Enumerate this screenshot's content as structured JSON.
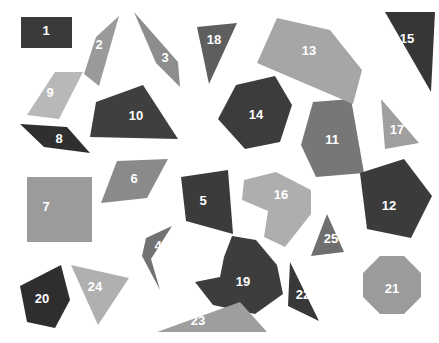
{
  "canvas": {
    "width": 439,
    "height": 343,
    "background": "#ffffff",
    "title": "shape-scatter-figure"
  },
  "palette": {
    "very_dark": "#333333",
    "dark": "#3d3d3d",
    "dark_gray": "#4a4a4a",
    "mid_dark": "#6b6b6b",
    "mid": "#808080",
    "mid_gray": "#999999",
    "light_gray": "#a8a8a8",
    "lighter_gray": "#b5b5b5",
    "lightest_gray": "#c2c2c2",
    "label_color": "#ffffff"
  },
  "chart_data": {
    "type": "scatter",
    "title": "",
    "xlabel": "",
    "ylabel": "",
    "grid": false,
    "legend": "none",
    "xlim": [
      0,
      439
    ],
    "ylim": [
      0,
      343
    ],
    "shape_count": 25
  },
  "shapes": [
    {
      "id": 1,
      "label": "1",
      "kind": "rectangle",
      "color": "#3a3a3a",
      "points": "21,17 72,17 72,48 21,48",
      "label_x": 46,
      "label_y": 32
    },
    {
      "id": 2,
      "label": "2",
      "kind": "quadrilateral",
      "color": "#9a9a9a",
      "points": "119,16 96,37 84,74 99,86",
      "label_x": 99,
      "label_y": 46
    },
    {
      "id": 3,
      "label": "3",
      "kind": "quadrilateral",
      "color": "#8d8d8d",
      "points": "134,12 178,62 180,87 156,63",
      "label_x": 165,
      "label_y": 59
    },
    {
      "id": 4,
      "label": "4",
      "kind": "arrow",
      "color": "#727272",
      "points": "172,226 151,259 160,290 142,256 146,238",
      "label_x": 158,
      "label_y": 247
    },
    {
      "id": 5,
      "label": "5",
      "kind": "quadrilateral",
      "color": "#3b3b3b",
      "points": "181,177 228,170 233,234 186,221",
      "label_x": 203,
      "label_y": 202
    },
    {
      "id": 6,
      "label": "6",
      "kind": "parallelogram",
      "color": "#8a8a8a",
      "points": "117,161 168,159 147,198 101,203",
      "label_x": 134,
      "label_y": 180
    },
    {
      "id": 7,
      "label": "7",
      "kind": "square",
      "color": "#9b9b9b",
      "points": "27,177 92,177 92,242 27,242",
      "label_x": 46,
      "label_y": 208
    },
    {
      "id": 8,
      "label": "8",
      "kind": "sliver-parallelogram",
      "color": "#2f2f2f",
      "points": "20,124 67,127 90,153 44,147",
      "label_x": 59,
      "label_y": 140
    },
    {
      "id": 9,
      "label": "9",
      "kind": "parallelogram",
      "color": "#b8b8b8",
      "points": "55,72 83,72 59,119 27,115",
      "label_x": 50,
      "label_y": 94
    },
    {
      "id": 10,
      "label": "10",
      "kind": "quadrilateral",
      "color": "#3f3f3f",
      "points": "96,102 143,85 178,139 90,137",
      "label_x": 136,
      "label_y": 117
    },
    {
      "id": 11,
      "label": "11",
      "kind": "pentagon",
      "color": "#777777",
      "points": "313,102 351,99 364,173 316,177 301,145",
      "label_x": 332,
      "label_y": 141
    },
    {
      "id": 12,
      "label": "12",
      "kind": "pentagon",
      "color": "#3b3b3b",
      "points": "360,173 404,159 432,196 411,238 367,229",
      "label_x": 389,
      "label_y": 207
    },
    {
      "id": 13,
      "label": "13",
      "kind": "pentagon",
      "color": "#a6a6a6",
      "points": "277,18 330,30 362,70 353,104 257,63",
      "label_x": 309,
      "label_y": 52
    },
    {
      "id": 14,
      "label": "14",
      "kind": "hexagon",
      "color": "#3c3c3c",
      "points": "236,85 275,76 292,105 280,142 245,149 218,119",
      "label_x": 256,
      "label_y": 116
    },
    {
      "id": 15,
      "label": "15",
      "kind": "triangle",
      "color": "#363636",
      "points": "385,12 435,12 431,92",
      "label_x": 407,
      "label_y": 40
    },
    {
      "id": 16,
      "label": "16",
      "kind": "heptagon",
      "color": "#aeaeae",
      "points": "276,172 311,190 311,214 285,247 264,237 268,211 242,200 244,180",
      "label_x": 281,
      "label_y": 196
    },
    {
      "id": 17,
      "label": "17",
      "kind": "triangle",
      "color": "#9f9f9f",
      "points": "381,99 419,143 385,149",
      "label_x": 397,
      "label_y": 131
    },
    {
      "id": 18,
      "label": "18",
      "kind": "triangle",
      "color": "#5e5e5e",
      "points": "197,27 237,23 209,84",
      "label_x": 214,
      "label_y": 41
    },
    {
      "id": 19,
      "label": "19",
      "kind": "concave-polygon",
      "color": "#3d3d3d",
      "points": "232,236 256,240 277,265 283,294 255,314 213,305 195,282 220,277 224,257",
      "label_x": 243,
      "label_y": 283
    },
    {
      "id": 20,
      "label": "20",
      "kind": "pentagon",
      "color": "#2e2e2e",
      "points": "61,265 70,300 55,328 27,322 20,286",
      "label_x": 42,
      "label_y": 300
    },
    {
      "id": 21,
      "label": "21",
      "kind": "octagon",
      "color": "#9b9b9b",
      "points": "380,256 404,256 421,273 421,297 404,314 380,314 363,297 363,273",
      "label_x": 392,
      "label_y": 290
    },
    {
      "id": 22,
      "label": "22",
      "kind": "triangle",
      "color": "#383838",
      "points": "290,262 319,321 288,306",
      "label_x": 303,
      "label_y": 296
    },
    {
      "id": 23,
      "label": "23",
      "kind": "triangle",
      "color": "#9e9e9e",
      "points": "240,302 157,332 267,332",
      "label_x": 198,
      "label_y": 322
    },
    {
      "id": 24,
      "label": "24",
      "kind": "triangle",
      "color": "#b0b0b0",
      "points": "71,265 129,278 98,325",
      "label_x": 95,
      "label_y": 288
    },
    {
      "id": 25,
      "label": "25",
      "kind": "triangle",
      "color": "#6f6f6f",
      "points": "327,214 344,252 311,256",
      "label_x": 331,
      "label_y": 240
    }
  ]
}
